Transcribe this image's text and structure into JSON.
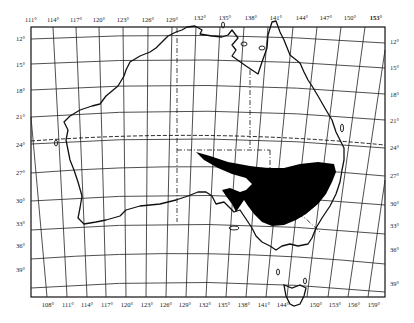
{
  "map": {
    "subject": "Australia with shaded distribution region",
    "top_longitude_labels": [
      "111°",
      "114°",
      "117°",
      "120°",
      "123°",
      "126°",
      "129°",
      "132°",
      "135°",
      "138°",
      "141°",
      "144°",
      "147°",
      "150°",
      "153°"
    ],
    "bottom_longitude_labels": [
      "108°",
      "111°",
      "114°",
      "117°",
      "120°",
      "123°",
      "126°",
      "129°",
      "132°",
      "135°",
      "138°",
      "141°",
      "144°",
      "150°",
      "153°",
      "156°",
      "159°"
    ],
    "left_latitude_labels": [
      "12°",
      "15°",
      "18°",
      "21°",
      "24°",
      "27°",
      "30°",
      "33°",
      "36°",
      "39°"
    ],
    "right_latitude_labels": [
      "12°",
      "15°",
      "18°",
      "21°",
      "24°",
      "27°",
      "30°",
      "33°",
      "36°",
      "39°"
    ],
    "features": {
      "tropic_line": "dashed line near 23.5°S",
      "state_borders": "dash-dot lines",
      "shaded_region": "solid black area covering inland south-east Australia (Lake Eyre basin to Murray-Darling)"
    },
    "colors": {
      "land_outline": "#111111",
      "grid": "#222222",
      "shaded": "#000000",
      "background": "#ffffff"
    }
  }
}
